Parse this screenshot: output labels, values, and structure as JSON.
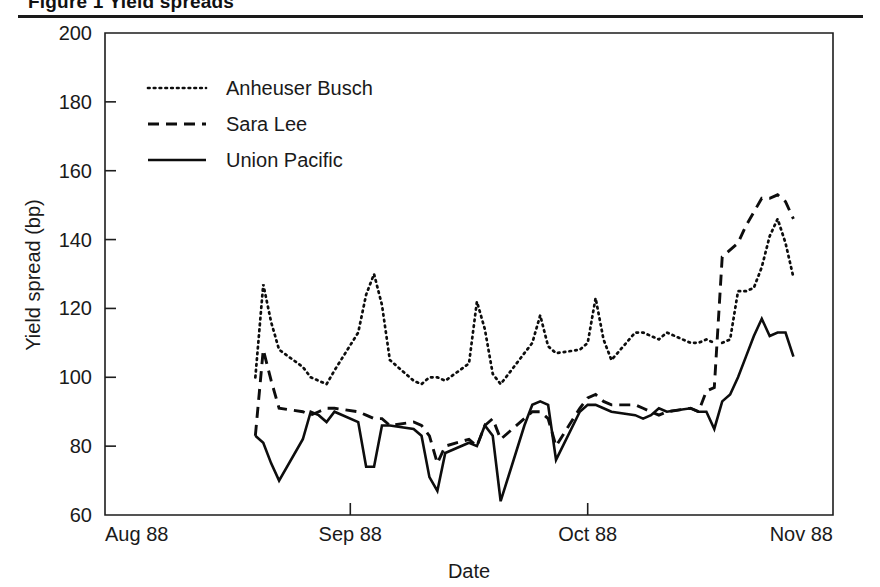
{
  "figure": {
    "title": "Figure 1  Yield spreads",
    "has_title_rule": true
  },
  "chart_data": {
    "type": "line",
    "title": "Figure 1  Yield spreads",
    "xlabel": "Date",
    "ylabel": "Yield spread (bp)",
    "xlim": [
      0,
      92
    ],
    "ylim": [
      60,
      200
    ],
    "yticks": [
      60,
      80,
      100,
      120,
      140,
      160,
      180,
      200
    ],
    "ytick_labels": [
      "60",
      "80",
      "100",
      "120",
      "140",
      "160",
      "180",
      "200"
    ],
    "xticks": [
      0,
      31,
      61,
      92
    ],
    "xtick_labels": [
      "Aug 88",
      "Sep 88",
      "Oct 88",
      "Nov 88"
    ],
    "grid": false,
    "legend_position": "upper left",
    "line_color": "#0d0d0d",
    "series": [
      {
        "name": "Anheuser Busch",
        "style": "dotted",
        "x": [
          19,
          20,
          21,
          22,
          25,
          26,
          27,
          28,
          29,
          32,
          33,
          34,
          35,
          36,
          39,
          40,
          41,
          42,
          43,
          46,
          47,
          48,
          49,
          50,
          53,
          54,
          55,
          56,
          57,
          60,
          61,
          62,
          63,
          64,
          67,
          68,
          69,
          70,
          71,
          74,
          75,
          76,
          77
        ],
        "y": [
          100,
          127,
          116,
          108,
          103,
          100,
          99,
          98,
          102,
          113,
          124,
          130,
          121,
          105,
          99,
          98,
          100,
          100,
          99,
          104,
          122,
          114,
          101,
          98,
          107,
          110,
          118,
          109,
          107,
          108,
          110,
          123,
          111,
          105,
          113,
          113,
          112,
          111,
          113,
          110,
          110,
          111,
          110
        ]
      },
      {
        "name": "Anheuser Busch (continued)",
        "style": "dotted",
        "x": [
          78,
          79,
          80,
          81,
          82,
          83,
          84,
          85,
          86,
          87
        ],
        "y": [
          110,
          111,
          125,
          125,
          126,
          132,
          141,
          146,
          139,
          129
        ]
      },
      {
        "name": "Sara Lee",
        "style": "dashed",
        "x": [
          19,
          20,
          21,
          22,
          25,
          26,
          27,
          28,
          29,
          32,
          33,
          34,
          35,
          36,
          39,
          40,
          41,
          42,
          43,
          46,
          47,
          48,
          49,
          50,
          53,
          54,
          55,
          56,
          57,
          60,
          61,
          62,
          63,
          64,
          67,
          68,
          69,
          70,
          71,
          74,
          75,
          76,
          77,
          78,
          79,
          80,
          81,
          82,
          83,
          84,
          85,
          86,
          87
        ],
        "y": [
          83,
          108,
          99,
          91,
          90,
          89,
          90,
          91,
          91,
          90,
          89,
          88,
          88,
          86,
          87,
          86,
          83,
          75,
          80,
          82,
          80,
          86,
          88,
          82,
          88,
          90,
          90,
          88,
          80,
          91,
          94,
          95,
          93,
          92,
          92,
          91,
          90,
          89,
          90,
          91,
          90,
          96,
          97,
          135,
          137,
          139,
          144,
          148,
          152,
          152,
          153,
          151,
          146
        ]
      },
      {
        "name": "Union Pacific",
        "style": "solid",
        "x": [
          19,
          20,
          21,
          22,
          25,
          26,
          27,
          28,
          29,
          32,
          33,
          34,
          35,
          36,
          39,
          40,
          41,
          42,
          43,
          46,
          47,
          48,
          49,
          50,
          53,
          54,
          55,
          56,
          57,
          60,
          61,
          62,
          63,
          64,
          67,
          68,
          69,
          70,
          71,
          74,
          75,
          76,
          77,
          78,
          79,
          80,
          81,
          82,
          83,
          84,
          85,
          86,
          87
        ],
        "y": [
          83,
          81,
          75,
          70,
          82,
          90,
          89,
          87,
          90,
          87,
          74,
          74,
          86,
          86,
          85,
          83,
          71,
          67,
          78,
          81,
          80,
          86,
          83,
          64,
          86,
          92,
          93,
          92,
          76,
          90,
          92,
          92,
          91,
          90,
          89,
          88,
          89,
          91,
          90,
          91,
          90,
          90,
          85,
          93,
          95,
          100,
          106,
          112,
          117,
          112,
          113,
          113,
          106
        ]
      }
    ]
  },
  "axes": {
    "y_title": "Yield spread (bp)",
    "x_title": "Date",
    "y_ticks": [
      "200",
      "180",
      "160",
      "140",
      "120",
      "100",
      "80",
      "60"
    ],
    "x_ticks": [
      "Aug 88",
      "Sep 88",
      "Oct 88",
      "Nov 88"
    ]
  },
  "legend": {
    "entries": [
      {
        "label": "Anheuser Busch",
        "style": "dotted"
      },
      {
        "label": "Sara Lee",
        "style": "dashed"
      },
      {
        "label": "Union Pacific",
        "style": "solid"
      }
    ]
  }
}
